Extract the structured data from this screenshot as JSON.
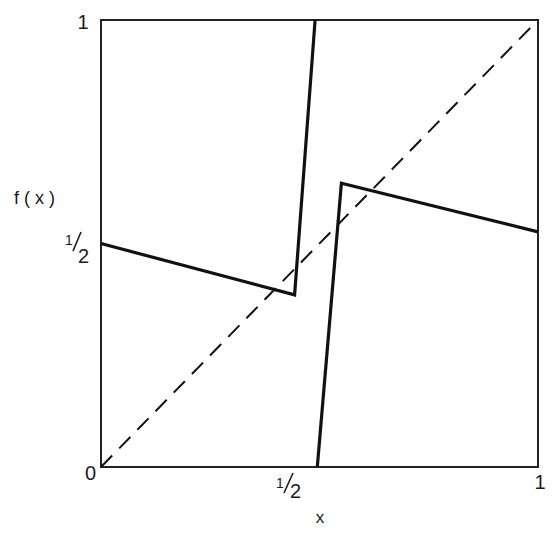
{
  "chart_data": {
    "type": "line",
    "title": "",
    "xlabel": "x",
    "ylabel": "f(x)",
    "xlim": [
      0,
      1
    ],
    "ylim": [
      0,
      1
    ],
    "grid": false,
    "x_ticks": [
      {
        "value": 0,
        "label": "0"
      },
      {
        "value": 0.5,
        "label": "1/2"
      },
      {
        "value": 1,
        "label": "1"
      }
    ],
    "y_ticks": [
      {
        "value": 0.5,
        "label": "1/2"
      },
      {
        "value": 1,
        "label": "1"
      }
    ],
    "series": [
      {
        "name": "f(x) left branch",
        "style": "solid",
        "points": [
          [
            0,
            0.5
          ],
          [
            0.443,
            0.385
          ],
          [
            0.49,
            1.0
          ]
        ]
      },
      {
        "name": "f(x) right branch",
        "style": "solid",
        "points": [
          [
            0.495,
            0.0
          ],
          [
            0.55,
            0.635
          ],
          [
            1.0,
            0.526
          ]
        ]
      },
      {
        "name": "diagonal y = x",
        "style": "dashed",
        "points": [
          [
            0,
            0
          ],
          [
            1,
            1
          ]
        ]
      }
    ]
  },
  "labels": {
    "origin": "0",
    "x_half_num": "1",
    "x_half_den": "2",
    "x_one": "1",
    "y_half_num": "1",
    "y_half_den": "2",
    "y_one": "1",
    "xlabel": "x",
    "ylabel": "f ( x )"
  }
}
